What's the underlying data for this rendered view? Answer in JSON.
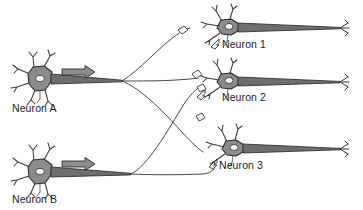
{
  "figure": {
    "background_color": "#ffffff",
    "width": 363,
    "height": 210
  },
  "palette": {
    "soma_fill": "#8b8b8b",
    "soma_outline": "#2b2b2b",
    "nucleus_fill": "#ffffff",
    "dendrite_stroke": "#3a3a3a",
    "axon_fill": "#6e6e6e",
    "arrow_fill": "#8d8d8d",
    "label_color": "#1a1a1a"
  },
  "presynaptic_neurons": [
    {
      "id": "neuron-a",
      "label": "Neuron A",
      "label_x": 12,
      "label_y": 112,
      "soma_center": [
        40,
        79
      ],
      "flow_arrow": {
        "name": "signal-direction-arrow-a",
        "x": 60,
        "y": 71,
        "direction": "right"
      }
    },
    {
      "id": "neuron-b",
      "label": "Neuron B",
      "label_x": 12,
      "label_y": 203,
      "soma_center": [
        40,
        172
      ],
      "flow_arrow": {
        "name": "signal-direction-arrow-b",
        "x": 60,
        "y": 163,
        "direction": "right"
      }
    }
  ],
  "postsynaptic_neurons": [
    {
      "id": "neuron-1",
      "label": "Neuron 1",
      "label_x": 222,
      "label_y": 48,
      "soma_center": [
        228,
        27
      ]
    },
    {
      "id": "neuron-2",
      "label": "Neuron 2",
      "label_x": 222,
      "label_y": 101,
      "soma_center": [
        228,
        81
      ]
    },
    {
      "id": "neuron-3",
      "label": "Neuron 3",
      "label_x": 219,
      "label_y": 169,
      "soma_center": [
        233,
        148
      ]
    }
  ],
  "connections": [
    {
      "from": "neuron-a",
      "to": "neuron-1",
      "type": "divergent-branch"
    },
    {
      "from": "neuron-a",
      "to": "neuron-2",
      "type": "divergent-branch"
    },
    {
      "from": "neuron-a",
      "to": "neuron-3",
      "type": "divergent-branch"
    },
    {
      "from": "neuron-b",
      "to": "neuron-2",
      "type": "divergent-branch"
    },
    {
      "from": "neuron-b",
      "to": "neuron-3",
      "type": "divergent-branch"
    }
  ]
}
